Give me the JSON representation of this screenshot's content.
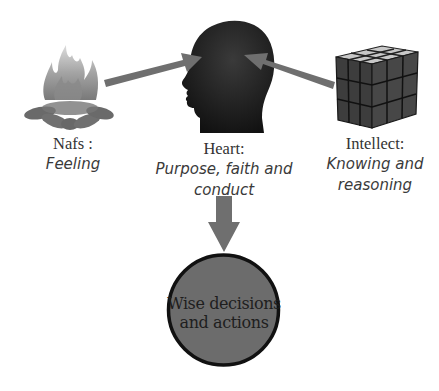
{
  "diagram": {
    "nodes": [
      {
        "id": "nafs",
        "icon": "campfire-icon",
        "title": "Nafs :",
        "subtitle": "Feeling"
      },
      {
        "id": "heart",
        "icon": "head-silhouette-icon",
        "title": "Heart:",
        "subtitle_line1": "Purpose, faith and",
        "subtitle_line2": "conduct"
      },
      {
        "id": "intellect",
        "icon": "rubiks-cube-icon",
        "title": "Intellect:",
        "subtitle_line1": "Knowing and",
        "subtitle_line2": "reasoning"
      }
    ],
    "outcome": {
      "line1": "Wise decisions",
      "line2": "and actions"
    },
    "edges": [
      {
        "from": "nafs",
        "to": "heart"
      },
      {
        "from": "intellect",
        "to": "heart"
      },
      {
        "from": "heart",
        "to": "outcome"
      }
    ],
    "colors": {
      "arrow": "#6f6f6f",
      "head": "#1c1c1c",
      "outcome_fill": "#6c6c6c",
      "outcome_border": "#111111",
      "cube_top": "#c9c9c9",
      "cube_side": "#3a3a3a"
    }
  }
}
